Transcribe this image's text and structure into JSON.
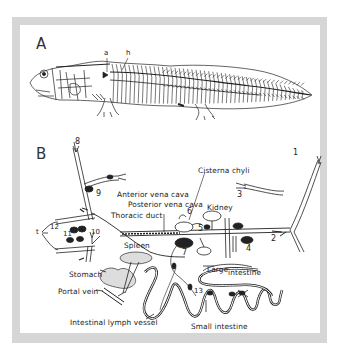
{
  "figure": {
    "panels": [
      {
        "id": "A",
        "label": "A",
        "annotations": [
          "a",
          "h"
        ]
      },
      {
        "id": "B",
        "label": "B"
      }
    ],
    "panel_b_labels": {
      "cisterna_chyli": "Cisterna chyli",
      "anterior_vena_cava": "Anterior vena cava",
      "posterior_vena_cava": "Posterior vena cava",
      "thoracic_duct": "Thoracic duct",
      "kidney": "Kidney",
      "spleen": "Spleen",
      "stomach": "Stomach",
      "portal_vein": "Portal vein",
      "large_intestine_1": "Large",
      "large_intestine_2": "intestine",
      "intestinal_lymph_vessel": "Intestinal lymph vessel",
      "small_intestine": "Small intestine"
    },
    "numbers": [
      "1",
      "2",
      "3",
      "4",
      "5",
      "6",
      "7",
      "8",
      "9",
      "10",
      "11",
      "12",
      "13"
    ],
    "side_letter": "t",
    "colors": {
      "frame": "#d6d6d6",
      "ink": "#222222",
      "background": "#ffffff"
    }
  }
}
